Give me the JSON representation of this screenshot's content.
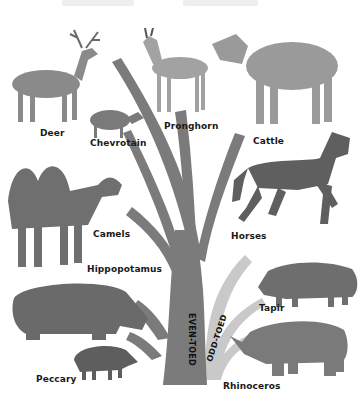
{
  "title_text_faded": [
    "",
    ""
  ],
  "groups": {
    "even_toed": {
      "label": "EVEN-TOED",
      "color": "#7a7a7a"
    },
    "odd_toed": {
      "label": "ODD-TOED",
      "color": "#c4c4c4"
    }
  },
  "animals": [
    {
      "name": "Deer",
      "group": "even_toed"
    },
    {
      "name": "Chevrotain",
      "group": "even_toed"
    },
    {
      "name": "Pronghorn",
      "group": "even_toed"
    },
    {
      "name": "Cattle",
      "group": "even_toed"
    },
    {
      "name": "Camels",
      "group": "even_toed"
    },
    {
      "name": "Hippopotamus",
      "group": "even_toed"
    },
    {
      "name": "Peccary",
      "group": "even_toed"
    },
    {
      "name": "Horses",
      "group": "odd_toed"
    },
    {
      "name": "Tapir",
      "group": "odd_toed"
    },
    {
      "name": "Rhinoceros",
      "group": "odd_toed"
    }
  ]
}
